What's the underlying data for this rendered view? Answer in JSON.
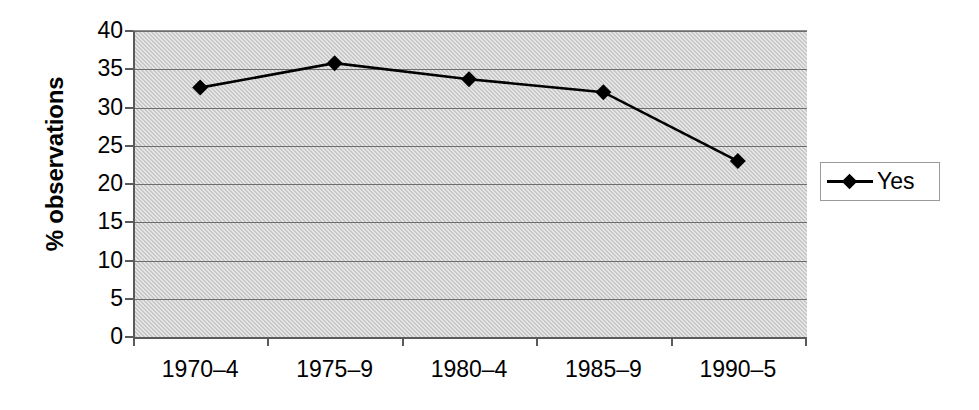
{
  "chart_data": {
    "type": "line",
    "title": "",
    "xlabel": "",
    "ylabel": "% observations",
    "categories": [
      "1970–4",
      "1975–9",
      "1980–4",
      "1985–9",
      "1990–5"
    ],
    "series": [
      {
        "name": "Yes",
        "values": [
          32.6,
          35.8,
          33.7,
          32.0,
          23.0
        ],
        "marker": "diamond",
        "color": "#000000"
      }
    ],
    "ylim": [
      0,
      40
    ],
    "yticks": [
      0,
      5,
      10,
      15,
      20,
      25,
      30,
      35,
      40
    ],
    "ytick_labels": [
      "0",
      "5",
      "10",
      "15",
      "20",
      "25",
      "30",
      "35",
      "40"
    ],
    "grid": "horizontal",
    "plot_background": "#c8c8c8",
    "gridline_color": "#6e6e6e",
    "axis_color": "#5a5a5a",
    "legend_position": "right",
    "legend_entries": [
      "Yes"
    ]
  }
}
